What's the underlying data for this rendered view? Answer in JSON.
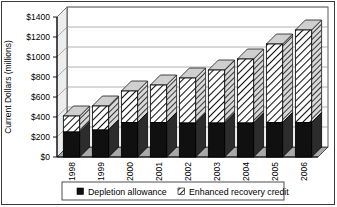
{
  "chart_data": {
    "type": "bar",
    "subtype": "stacked-column-3d",
    "title": "",
    "xlabel": "",
    "ylabel": "Current Dollars (millions)",
    "categories": [
      "1998",
      "1999",
      "2000",
      "2001",
      "2002",
      "2003",
      "2004",
      "2005",
      "2006"
    ],
    "series": [
      {
        "name": "Depletion allowance",
        "marker": "solid-black-square",
        "color": "#101010",
        "values": [
          250,
          270,
          345,
          345,
          340,
          340,
          340,
          345,
          345
        ]
      },
      {
        "name": "Enhanced recovery credit",
        "marker": "hatched-square",
        "color": "#ffffff",
        "values": [
          160,
          240,
          315,
          375,
          450,
          530,
          640,
          785,
          925
        ]
      }
    ],
    "totals": [
      410,
      510,
      660,
      720,
      790,
      870,
      980,
      1130,
      1270
    ],
    "ylim": [
      0,
      1400
    ],
    "ytick_step": 200,
    "ytick_labels": [
      "$0",
      "$200",
      "$400",
      "$600",
      "$800",
      "$1000",
      "$1200",
      "$1400"
    ],
    "ytick_values": [
      0,
      200,
      400,
      600,
      800,
      1000,
      1200,
      1400
    ],
    "grid": true,
    "grid_axis": "y",
    "legend_position": "bottom",
    "legend_entries": [
      "Depletion allowance",
      "Enhanced recovery credit"
    ],
    "border": true,
    "plot_background": "#ffffff",
    "floor_color": "#a8a8a8",
    "axis_color": "#000000",
    "gridline_color": "#9a9a9a"
  }
}
